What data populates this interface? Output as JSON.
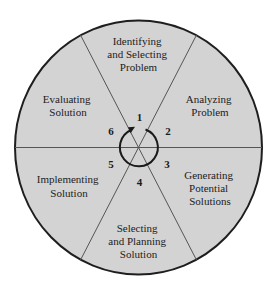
{
  "diagram": {
    "colors": {
      "background": "#ffffff",
      "wheel_fill": "#d3d3d3",
      "outline": "#1e1e1e",
      "divider": "#555555",
      "text": "#1c1c1c"
    },
    "steps": [
      {
        "number": "1",
        "lines": [
          "Identifying",
          "and Selecting",
          "Problem"
        ]
      },
      {
        "number": "2",
        "lines": [
          "Analyzing",
          "Problem"
        ]
      },
      {
        "number": "3",
        "lines": [
          "Generating",
          "Potential",
          "Solutions"
        ]
      },
      {
        "number": "4",
        "lines": [
          "Selecting",
          "and Planning",
          "Solution"
        ]
      },
      {
        "number": "5",
        "lines": [
          "Implementing",
          "Solution"
        ]
      },
      {
        "number": "6",
        "lines": [
          "Evaluating",
          "Solution"
        ]
      }
    ],
    "center_icon": "clockwise-cycle-arrow-icon"
  }
}
